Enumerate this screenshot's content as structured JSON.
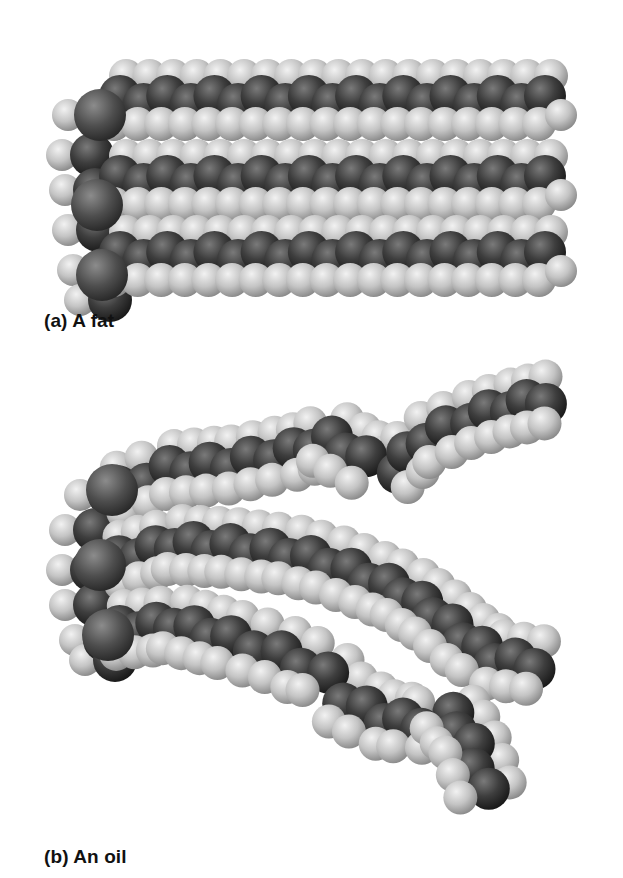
{
  "figure": {
    "panels": [
      {
        "id": "a",
        "caption": "(a) A fat",
        "description": "Space-filling model of a saturated triglyceride: three straight, tightly packed hydrocarbon chains"
      },
      {
        "id": "b",
        "caption": "(b) An oil",
        "description": "Space-filling model of an unsaturated triglyceride: three kinked hydrocarbon chains"
      }
    ],
    "colors": {
      "carbon": "#3c3c3c",
      "oxygen": "#555555",
      "hydrogen": "#c8c8c8",
      "background": "#ffffff",
      "caption_text": "#111111"
    },
    "legend": {
      "carbon_label": "",
      "hydrogen_label": ""
    }
  },
  "models": {
    "fat": {
      "backbone": [
        [
          98,
          115
        ],
        [
          92,
          155
        ],
        [
          95,
          190
        ],
        [
          98,
          230
        ],
        [
          103,
          270
        ],
        [
          110,
          300
        ]
      ],
      "chains": [
        {
          "start": [
            120,
            100
          ],
          "end": [
            545,
            100
          ],
          "count": 9
        },
        {
          "start": [
            120,
            180
          ],
          "end": [
            545,
            180
          ],
          "count": 9
        },
        {
          "start": [
            120,
            256
          ],
          "end": [
            545,
            256
          ],
          "count": 9
        }
      ]
    },
    "oil": {
      "backbone": [
        [
          110,
          495
        ],
        [
          95,
          530
        ],
        [
          92,
          570
        ],
        [
          95,
          605
        ],
        [
          105,
          640
        ],
        [
          115,
          660
        ]
      ],
      "chains": [
        {
          "points": [
            [
              120,
              490
            ],
            [
              170,
              470
            ],
            [
              230,
              465
            ],
            [
              295,
              452
            ],
            [
              330,
              440
            ],
            [
              365,
              460
            ],
            [
              395,
              470
            ],
            [
              425,
              440
            ],
            [
              470,
              420
            ],
            [
              510,
              408
            ],
            [
              545,
              400
            ]
          ]
        },
        {
          "points": [
            [
              120,
              560
            ],
            [
              175,
              545
            ],
            [
              230,
              548
            ],
            [
              290,
              555
            ],
            [
              330,
              565
            ],
            [
              370,
              580
            ],
            [
              405,
              595
            ],
            [
              435,
              615
            ],
            [
              465,
              640
            ],
            [
              495,
              660
            ],
            [
              535,
              665
            ]
          ]
        },
        {
          "points": [
            [
              120,
              630
            ],
            [
              175,
              625
            ],
            [
              230,
              640
            ],
            [
              280,
              655
            ],
            [
              325,
              675
            ],
            [
              345,
              700
            ],
            [
              385,
              720
            ],
            [
              420,
              725
            ],
            [
              450,
              715
            ],
            [
              470,
              745
            ],
            [
              485,
              790
            ]
          ]
        }
      ]
    }
  }
}
